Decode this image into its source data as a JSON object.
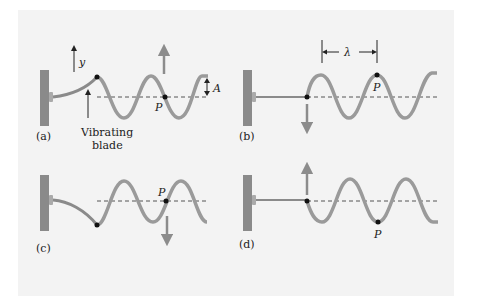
{
  "figure": {
    "colors": {
      "background": "#f3f3f3",
      "wall": "#8a8a8a",
      "string": "#9a9a9a",
      "dashed_axis": "#555555",
      "arrow_gray": "#8c8c8c",
      "text": "#222222"
    },
    "panels": [
      {
        "id": "a",
        "label": "(a)",
        "point": "P",
        "annotations": [
          "y",
          "A",
          "Vibrating",
          "blade"
        ],
        "velocity_arrow": "up"
      },
      {
        "id": "b",
        "label": "(b)",
        "point": "P",
        "annotations": [
          "λ"
        ],
        "velocity_arrow": "down"
      },
      {
        "id": "c",
        "label": "(c)",
        "point": "P",
        "annotations": [],
        "velocity_arrow": "down"
      },
      {
        "id": "d",
        "label": "(d)",
        "point": "P",
        "annotations": [],
        "velocity_arrow": "up"
      }
    ]
  }
}
